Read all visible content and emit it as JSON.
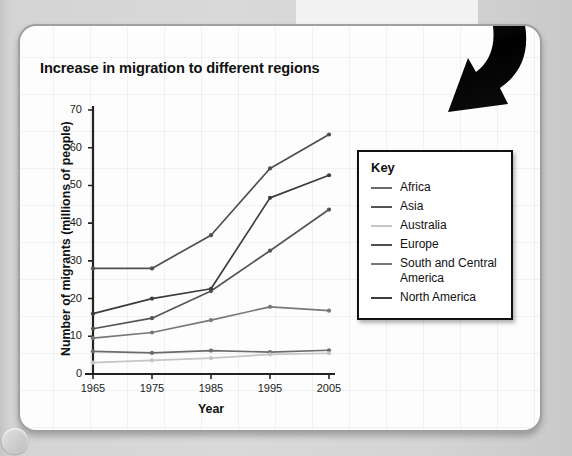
{
  "chart_data": {
    "type": "line",
    "title": "Increase in migration to different regions",
    "xlabel": "Year",
    "ylabel": "Number of migrants (millions of people)",
    "x": [
      1965,
      1975,
      1985,
      1995,
      2005
    ],
    "xtick_labels": [
      "1965",
      "1975",
      "1985",
      "1995",
      "2005"
    ],
    "ytick_labels": [
      "0",
      "10",
      "20",
      "30",
      "40",
      "50",
      "60",
      "70"
    ],
    "yticks": [
      0,
      10,
      20,
      30,
      40,
      50,
      60,
      70
    ],
    "ylim": [
      0,
      70
    ],
    "xlim": [
      1965,
      2005
    ],
    "grid": false,
    "legend_position": "right",
    "legend_title": "Key",
    "series": [
      {
        "name": "Africa",
        "values": [
          6.0,
          5.6,
          6.2,
          5.8,
          6.3
        ],
        "color": "#6b6b6b"
      },
      {
        "name": "Asia",
        "values": [
          12.0,
          14.8,
          22.0,
          32.7,
          43.6
        ],
        "color": "#555555"
      },
      {
        "name": "Australia",
        "values": [
          3.0,
          3.6,
          4.2,
          5.2,
          5.5
        ],
        "color": "#c5c5c5"
      },
      {
        "name": "Europe",
        "values": [
          28.0,
          28.0,
          36.8,
          54.5,
          63.5
        ],
        "color": "#4f4f4f"
      },
      {
        "name": "South and Central America",
        "values": [
          9.5,
          11.0,
          14.3,
          17.8,
          16.8
        ],
        "color": "#787878"
      },
      {
        "name": "North America",
        "values": [
          16.0,
          20.0,
          22.6,
          46.7,
          52.7
        ],
        "color": "#3d3d3d"
      }
    ]
  },
  "legend": {
    "title": "Key",
    "items": [
      {
        "label": "Africa"
      },
      {
        "label": "Asia"
      },
      {
        "label": "Australia"
      },
      {
        "label": "Europe"
      },
      {
        "label": "South and Central America"
      },
      {
        "label": "North America"
      }
    ]
  },
  "icons": {
    "corner_arrow": "curved-down-arrow-icon",
    "corner_ring": "ring-icon"
  }
}
